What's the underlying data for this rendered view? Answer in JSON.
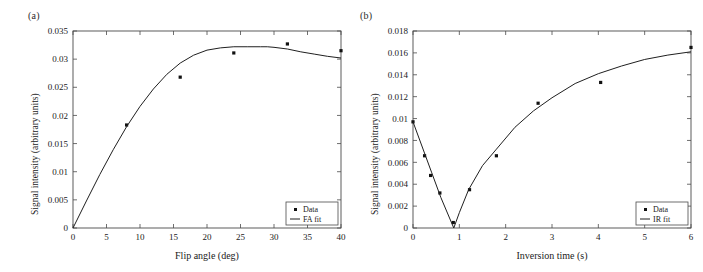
{
  "figure": {
    "panel_a_label": "(a)",
    "panel_b_label": "(b)"
  },
  "chart_data": [
    {
      "id": "panel-a",
      "type": "scatter",
      "panel": "(a)",
      "title": "",
      "xlabel": "Flip angle (deg)",
      "ylabel": "Signal intensity (arbitrary units)",
      "xlim": [
        0,
        40
      ],
      "ylim": [
        0,
        0.035
      ],
      "xticks": [
        0,
        5,
        10,
        15,
        20,
        25,
        30,
        35,
        40
      ],
      "xticklabels": [
        "0",
        "5",
        "10",
        "15",
        "20",
        "25",
        "30",
        "35",
        "40"
      ],
      "yticks": [
        0,
        0.005,
        0.01,
        0.015,
        0.02,
        0.025,
        0.03,
        0.035
      ],
      "yticklabels": [
        "0",
        "0.005",
        "0.01",
        "0.015",
        "0.02",
        "0.025",
        "0.03",
        "0.035"
      ],
      "grid": false,
      "legend_position": "lower right",
      "series": [
        {
          "name": "Data",
          "kind": "markers",
          "marker": "square-dot",
          "color": "#111111",
          "x": [
            8,
            16,
            24,
            32,
            40
          ],
          "y": [
            0.0183,
            0.0268,
            0.0311,
            0.0327,
            0.0315
          ]
        },
        {
          "name": "FA fit",
          "kind": "line",
          "color": "#1f1f1f",
          "x": [
            0,
            2,
            4,
            6,
            8,
            10,
            12,
            14,
            16,
            18,
            20,
            22,
            24,
            26,
            28,
            29,
            30,
            32,
            34,
            36,
            38,
            40
          ],
          "y": [
            0.0,
            0.0048,
            0.0095,
            0.0139,
            0.018,
            0.0216,
            0.0247,
            0.0273,
            0.0293,
            0.0307,
            0.0316,
            0.032,
            0.0322,
            0.0322,
            0.0322,
            0.0322,
            0.0321,
            0.0318,
            0.0313,
            0.0309,
            0.0305,
            0.0302
          ]
        }
      ]
    },
    {
      "id": "panel-b",
      "type": "scatter",
      "panel": "(b)",
      "title": "",
      "xlabel": "Inversion time (s)",
      "ylabel": "Signal intensity (arbitrary units)",
      "xlim": [
        0,
        6
      ],
      "ylim": [
        0,
        0.018
      ],
      "xticks": [
        0,
        1,
        2,
        3,
        4,
        5,
        6
      ],
      "xticklabels": [
        "0",
        "1",
        "2",
        "3",
        "4",
        "5",
        "6"
      ],
      "yticks": [
        0,
        0.002,
        0.004,
        0.006,
        0.008,
        0.01,
        0.012,
        0.014,
        0.016,
        0.018
      ],
      "yticklabels": [
        "0",
        "0.002",
        "0.004",
        "0.006",
        "0.008",
        "0.01",
        "0.012",
        "0.014",
        "0.016",
        "0.018"
      ],
      "grid": false,
      "legend_position": "lower right",
      "series": [
        {
          "name": "Data",
          "kind": "markers",
          "marker": "square-dot",
          "color": "#111111",
          "x": [
            0.0,
            0.25,
            0.38,
            0.58,
            0.87,
            1.22,
            1.8,
            2.7,
            4.05,
            6.0
          ],
          "y": [
            0.0097,
            0.0066,
            0.0048,
            0.0032,
            0.0005,
            0.0035,
            0.0066,
            0.0114,
            0.0133,
            0.0165
          ]
        },
        {
          "name": "IR fit",
          "kind": "line",
          "color": "#1f1f1f",
          "x": [
            0.0,
            0.2,
            0.4,
            0.6,
            0.88,
            1.0,
            1.2,
            1.5,
            1.8,
            2.2,
            2.6,
            3.0,
            3.5,
            4.0,
            4.5,
            5.0,
            5.5,
            6.0
          ],
          "y": [
            0.0097,
            0.0074,
            0.0051,
            0.0028,
            0.0,
            0.0014,
            0.0035,
            0.0057,
            0.0072,
            0.0092,
            0.0107,
            0.0119,
            0.0132,
            0.0141,
            0.0148,
            0.0154,
            0.0158,
            0.0161
          ]
        }
      ]
    }
  ]
}
